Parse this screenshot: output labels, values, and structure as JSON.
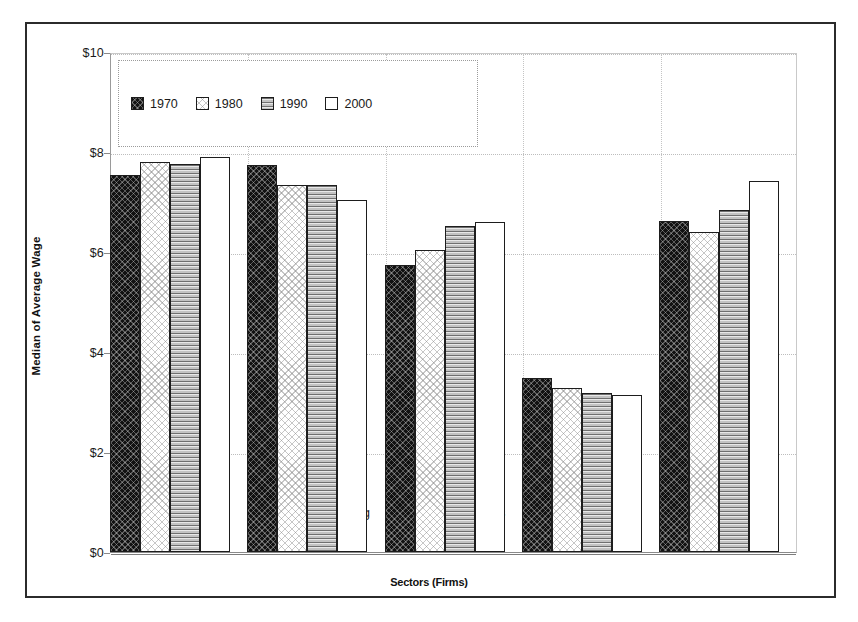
{
  "chart_data": {
    "type": "bar",
    "title": "",
    "xlabel": "Sectors (Firms)",
    "ylabel": "Median of Average Wage",
    "ylim": [
      0,
      10
    ],
    "yticks": [
      "$0",
      "$2",
      "$4",
      "$6",
      "$8",
      "$10"
    ],
    "ytick_values": [
      0,
      2,
      4,
      6,
      8,
      10
    ],
    "grid": true,
    "legend_position": "top-left inside plot",
    "categories": [
      "Old Manufacturing",
      "New Manufacturing",
      "High-End Services",
      "Low-End Services",
      "FIRE"
    ],
    "series": [
      {
        "name": "1970",
        "pattern": "black-crosshatch",
        "values": [
          7.55,
          7.75,
          5.75,
          3.48,
          6.62
        ]
      },
      {
        "name": "1980",
        "pattern": "white-speckle",
        "values": [
          7.8,
          7.35,
          6.05,
          3.28,
          6.4
        ]
      },
      {
        "name": "1990",
        "pattern": "gray-horizontal-lines",
        "values": [
          7.77,
          7.35,
          6.52,
          3.18,
          6.85
        ]
      },
      {
        "name": "2000",
        "pattern": "white-plain",
        "values": [
          7.9,
          7.05,
          6.6,
          3.15,
          7.43
        ]
      }
    ]
  },
  "legend": {
    "entries": [
      {
        "label": "1970"
      },
      {
        "label": "1980"
      },
      {
        "label": "1990"
      },
      {
        "label": "2000"
      }
    ]
  },
  "colors": {
    "frame": "#2b2b2b",
    "gridline": "#bdbdbd",
    "bar_outline": "#1d1d1d",
    "series_1970": "#121212",
    "series_1980": "#ffffff",
    "series_1990": "#d2d2d2",
    "series_2000": "#ffffff",
    "text": "#1a1a1a",
    "background": "#ffffff"
  }
}
